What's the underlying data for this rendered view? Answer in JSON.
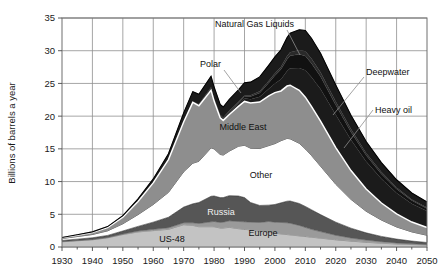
{
  "chart_data": {
    "type": "area",
    "title": "",
    "xlabel": "",
    "ylabel": "Billions of barrels a year",
    "xlim": [
      1930,
      2050
    ],
    "ylim": [
      0,
      35
    ],
    "grid": true,
    "legend_position": "inline-annotations",
    "xticks": [
      "1930",
      "1940",
      "1950",
      "1960",
      "1970",
      "1980",
      "1990",
      "2000",
      "2010",
      "2020",
      "2030",
      "2040",
      "2050"
    ],
    "yticks": [
      "0",
      "5",
      "10",
      "15",
      "20",
      "25",
      "30",
      "35"
    ],
    "x": [
      1930,
      1935,
      1940,
      1945,
      1950,
      1955,
      1960,
      1965,
      1970,
      1973,
      1975,
      1979,
      1980,
      1982,
      1983,
      1985,
      1988,
      1990,
      1992,
      1995,
      1998,
      2000,
      2002,
      2004,
      2005,
      2008,
      2010,
      2012,
      2015,
      2020,
      2025,
      2030,
      2035,
      2040,
      2045,
      2050
    ],
    "stack_order_bottom_to_top": [
      "US-48",
      "Europe",
      "Russia",
      "Other",
      "Middle East",
      "Heavy oil",
      "Deepwater",
      "Polar",
      "Natural Gas Liquids"
    ],
    "series": [
      {
        "name": "US-48",
        "color": "#c3c3c3",
        "values": [
          0.8,
          0.95,
          1.1,
          1.4,
          1.9,
          2.3,
          2.5,
          2.7,
          3.4,
          3.3,
          3.1,
          3.1,
          3.1,
          2.9,
          2.9,
          3.0,
          2.8,
          2.7,
          2.6,
          2.4,
          2.3,
          2.1,
          2.0,
          1.9,
          1.85,
          1.7,
          1.6,
          1.5,
          1.35,
          1.1,
          0.9,
          0.72,
          0.58,
          0.46,
          0.37,
          0.3
        ]
      },
      {
        "name": "Europe",
        "color": "#9a9a9a",
        "values": [
          0.05,
          0.05,
          0.06,
          0.07,
          0.1,
          0.15,
          0.2,
          0.25,
          0.3,
          0.4,
          0.5,
          0.75,
          0.8,
          0.85,
          0.9,
          1.0,
          1.1,
          1.15,
          1.2,
          1.35,
          1.6,
          1.7,
          1.75,
          1.8,
          1.78,
          1.6,
          1.4,
          1.2,
          1.0,
          0.7,
          0.48,
          0.34,
          0.24,
          0.17,
          0.12,
          0.09
        ]
      },
      {
        "name": "Russia",
        "color": "#565656",
        "values": [
          0.15,
          0.2,
          0.25,
          0.3,
          0.45,
          0.7,
          1.1,
          1.6,
          2.4,
          2.9,
          3.2,
          3.9,
          3.9,
          3.8,
          3.75,
          3.85,
          3.9,
          3.7,
          3.0,
          2.6,
          2.5,
          2.7,
          3.0,
          3.3,
          3.4,
          3.35,
          3.2,
          3.0,
          2.6,
          2.0,
          1.5,
          1.1,
          0.8,
          0.58,
          0.42,
          0.3
        ]
      },
      {
        "name": "Other",
        "color": "#ffffff",
        "values": [
          0.3,
          0.4,
          0.5,
          0.7,
          1.1,
          1.8,
          2.7,
          3.8,
          5.4,
          6.2,
          6.3,
          7.4,
          7.2,
          6.6,
          6.5,
          6.8,
          7.6,
          8.0,
          8.3,
          8.7,
          9.1,
          9.3,
          9.5,
          9.6,
          9.5,
          9.2,
          8.8,
          8.3,
          7.4,
          5.8,
          4.4,
          3.3,
          2.5,
          1.85,
          1.4,
          1.1
        ]
      },
      {
        "name": "Middle East",
        "color": "#8e8e8e",
        "values": [
          0.1,
          0.2,
          0.3,
          0.5,
          1.0,
          2.0,
          3.3,
          5.0,
          7.6,
          9.3,
          8.5,
          8.8,
          7.3,
          5.6,
          5.3,
          5.6,
          6.1,
          6.7,
          6.9,
          7.1,
          7.6,
          7.8,
          7.6,
          8.0,
          8.2,
          8.1,
          7.9,
          7.5,
          6.9,
          5.6,
          4.4,
          3.4,
          2.6,
          2.0,
          1.5,
          1.2
        ]
      },
      {
        "name": "Heavy oil",
        "color": "#1b1b1b",
        "values": [
          0.0,
          0.0,
          0.0,
          0.0,
          0.0,
          0.0,
          0.0,
          0.05,
          0.1,
          0.15,
          0.2,
          0.3,
          0.3,
          0.3,
          0.3,
          0.35,
          0.4,
          0.5,
          0.6,
          0.8,
          1.1,
          1.4,
          1.8,
          2.3,
          2.6,
          3.4,
          4.1,
          4.5,
          4.9,
          5.0,
          4.7,
          4.2,
          3.7,
          3.2,
          2.8,
          2.5
        ]
      },
      {
        "name": "Deepwater",
        "color": "#111111",
        "values": [
          0.0,
          0.0,
          0.0,
          0.0,
          0.0,
          0.0,
          0.0,
          0.0,
          0.0,
          0.0,
          0.05,
          0.1,
          0.1,
          0.1,
          0.1,
          0.15,
          0.2,
          0.3,
          0.4,
          0.6,
          0.9,
          1.2,
          1.5,
          1.8,
          1.9,
          2.1,
          2.2,
          2.1,
          1.9,
          1.5,
          1.2,
          0.95,
          0.75,
          0.6,
          0.48,
          0.4
        ]
      },
      {
        "name": "Polar",
        "color": "#2a2a2a",
        "values": [
          0.0,
          0.0,
          0.0,
          0.0,
          0.0,
          0.0,
          0.0,
          0.0,
          0.0,
          0.0,
          0.0,
          0.05,
          0.05,
          0.05,
          0.05,
          0.1,
          0.1,
          0.15,
          0.2,
          0.25,
          0.3,
          0.35,
          0.4,
          0.5,
          0.55,
          0.65,
          0.7,
          0.7,
          0.65,
          0.55,
          0.45,
          0.36,
          0.28,
          0.22,
          0.17,
          0.14
        ]
      },
      {
        "name": "Natural Gas Liquids",
        "color": "#1b1b1b",
        "values": [
          0.05,
          0.07,
          0.1,
          0.15,
          0.25,
          0.4,
          0.6,
          0.85,
          1.3,
          1.5,
          1.5,
          1.7,
          1.7,
          1.6,
          1.6,
          1.7,
          1.8,
          1.9,
          2.0,
          2.2,
          2.4,
          2.5,
          2.6,
          2.8,
          2.9,
          3.1,
          3.2,
          3.1,
          2.9,
          2.5,
          2.1,
          1.75,
          1.45,
          1.2,
          1.0,
          0.85
        ]
      }
    ],
    "total_peak": {
      "year": 2010,
      "value": 31.1
    },
    "annotations": [
      {
        "label": "Natural Gas Liquids",
        "target_series": "Natural Gas Liquids"
      },
      {
        "label": "Polar",
        "target_series": "Polar"
      },
      {
        "label": "Deepwater",
        "target_series": "Deepwater"
      },
      {
        "label": "Heavy oil",
        "target_series": "Heavy oil"
      },
      {
        "label": "Middle East",
        "target_series": "Middle East"
      },
      {
        "label": "Other",
        "target_series": "Other"
      },
      {
        "label": "Russia",
        "target_series": "Russia"
      },
      {
        "label": "Europe",
        "target_series": "Europe"
      },
      {
        "label": "US-48",
        "target_series": "US-48"
      }
    ]
  },
  "axis": {
    "y_title": "Billions of barrels a year",
    "y_ticks": [
      "0",
      "5",
      "10",
      "15",
      "20",
      "25",
      "30",
      "35"
    ],
    "x_ticks": [
      "1930",
      "1940",
      "1950",
      "1960",
      "1970",
      "1980",
      "1990",
      "2000",
      "2010",
      "2020",
      "2030",
      "2040",
      "2050"
    ]
  },
  "labels": {
    "natural_gas_liquids": "Natural Gas Liquids",
    "polar": "Polar",
    "deepwater": "Deepwater",
    "heavy_oil": "Heavy oil",
    "middle_east": "Middle East",
    "other": "Other",
    "russia": "Russia",
    "europe": "Europe",
    "us48": "US-48"
  }
}
